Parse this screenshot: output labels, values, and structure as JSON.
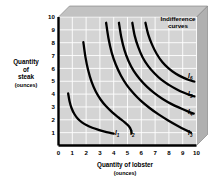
{
  "chart_data": {
    "type": "line",
    "title": "",
    "xlabel": "Quantity of lobster",
    "xunit": "(ounces)",
    "ylabel_lines": [
      "Quantity",
      "of",
      "steak"
    ],
    "yunit": "(ounces)",
    "xlim": [
      0,
      10
    ],
    "ylim": [
      0,
      10
    ],
    "xticks": [
      "0",
      "1",
      "2",
      "3",
      "4",
      "5",
      "6",
      "7",
      "8",
      "9",
      "10"
    ],
    "yticks": [
      "1",
      "2",
      "3",
      "4",
      "5",
      "6",
      "7",
      "8",
      "9",
      "10"
    ],
    "grid": true,
    "legend": "none",
    "annotation": {
      "text_lines": [
        "Indifference",
        "curves"
      ],
      "x": 7.6,
      "y": 9.3
    },
    "series": [
      {
        "name": "I1",
        "label": "I",
        "subscript": "1",
        "label_x": 4.25,
        "label_y": 0.78,
        "points": [
          [
            0.7,
            4.05
          ],
          [
            0.8,
            3.45
          ],
          [
            0.95,
            2.9
          ],
          [
            1.15,
            2.45
          ],
          [
            1.4,
            2.08
          ],
          [
            1.7,
            1.8
          ],
          [
            2.05,
            1.57
          ],
          [
            2.45,
            1.38
          ],
          [
            2.9,
            1.22
          ],
          [
            3.35,
            1.08
          ],
          [
            3.8,
            0.97
          ],
          [
            4.0,
            0.92
          ]
        ]
      },
      {
        "name": "I2",
        "label": "I",
        "subscript": "2",
        "label_x": 5.35,
        "label_y": 0.78,
        "points": [
          [
            1.8,
            8.05
          ],
          [
            1.95,
            6.9
          ],
          [
            2.15,
            5.85
          ],
          [
            2.4,
            4.95
          ],
          [
            2.7,
            4.2
          ],
          [
            3.05,
            3.58
          ],
          [
            3.45,
            3.05
          ],
          [
            3.9,
            2.58
          ],
          [
            4.35,
            2.18
          ],
          [
            4.8,
            1.8
          ],
          [
            5.1,
            1.5
          ],
          [
            5.25,
            1.22
          ],
          [
            5.3,
            0.95
          ]
        ]
      },
      {
        "name": "I3",
        "label": "I",
        "subscript": "3",
        "label_x": 9.55,
        "label_y": 0.8,
        "points": [
          [
            3.45,
            9.55
          ],
          [
            3.62,
            8.35
          ],
          [
            3.85,
            7.25
          ],
          [
            4.15,
            6.3
          ],
          [
            4.52,
            5.45
          ],
          [
            4.95,
            4.7
          ],
          [
            5.45,
            4.05
          ],
          [
            6.0,
            3.45
          ],
          [
            6.6,
            2.92
          ],
          [
            7.25,
            2.42
          ],
          [
            7.95,
            1.95
          ],
          [
            8.65,
            1.52
          ],
          [
            9.25,
            1.18
          ],
          [
            9.6,
            1.0
          ]
        ]
      },
      {
        "name": "I4",
        "label": "I",
        "subscript": "4",
        "label_x": 9.55,
        "label_y": 2.42,
        "points": [
          [
            4.38,
            9.55
          ],
          [
            4.55,
            8.42
          ],
          [
            4.78,
            7.42
          ],
          [
            5.08,
            6.55
          ],
          [
            5.45,
            5.8
          ],
          [
            5.9,
            5.15
          ],
          [
            6.4,
            4.58
          ],
          [
            6.95,
            4.08
          ],
          [
            7.55,
            3.62
          ],
          [
            8.2,
            3.22
          ],
          [
            8.85,
            2.9
          ],
          [
            9.45,
            2.62
          ],
          [
            9.8,
            2.48
          ]
        ]
      },
      {
        "name": "I5",
        "label": "I",
        "subscript": "5",
        "label_x": 9.55,
        "label_y": 3.85,
        "points": [
          [
            5.35,
            9.55
          ],
          [
            5.52,
            8.55
          ],
          [
            5.78,
            7.65
          ],
          [
            6.1,
            6.85
          ],
          [
            6.5,
            6.18
          ],
          [
            6.95,
            5.62
          ],
          [
            7.45,
            5.12
          ],
          [
            8.0,
            4.72
          ],
          [
            8.55,
            4.38
          ],
          [
            9.1,
            4.1
          ],
          [
            9.6,
            3.9
          ],
          [
            9.85,
            3.82
          ]
        ]
      },
      {
        "name": "I6",
        "label": "I",
        "subscript": "6",
        "label_x": 9.55,
        "label_y": 5.25,
        "points": [
          [
            6.3,
            9.55
          ],
          [
            6.5,
            8.65
          ],
          [
            6.78,
            7.85
          ],
          [
            7.12,
            7.12
          ],
          [
            7.52,
            6.5
          ],
          [
            7.98,
            6.0
          ],
          [
            8.48,
            5.6
          ],
          [
            9.0,
            5.3
          ],
          [
            9.5,
            5.08
          ],
          [
            9.85,
            4.98
          ]
        ]
      }
    ],
    "colors": {
      "plot_background": "#d4d4d4",
      "grid_line": "#ffffff",
      "curve": "#000000",
      "axis": "#000000",
      "shadow_side": "#b0b0b0",
      "shadow_top": "#c2c2c2",
      "text": "#000000"
    }
  }
}
